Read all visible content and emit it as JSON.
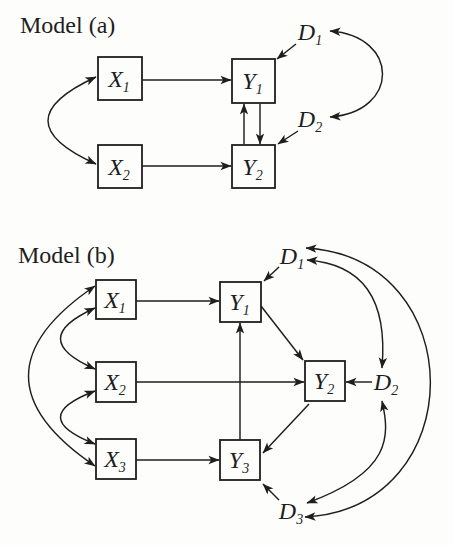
{
  "figure": {
    "background": "#fdfdfb",
    "ink": "#1e1e1e",
    "models": [
      {
        "id": "a",
        "title": "Model (a)",
        "nodes": [
          {
            "id": "X1",
            "letter": "X",
            "sub": "1",
            "box": {
              "x": 98,
              "y": 57,
              "w": 44,
              "h": 43
            }
          },
          {
            "id": "X2",
            "letter": "X",
            "sub": "2",
            "box": {
              "x": 98,
              "y": 145,
              "w": 44,
              "h": 43
            }
          },
          {
            "id": "Y1",
            "letter": "Y",
            "sub": "1",
            "box": {
              "x": 232,
              "y": 59,
              "w": 43,
              "h": 44
            }
          },
          {
            "id": "Y2",
            "letter": "Y",
            "sub": "2",
            "box": {
              "x": 232,
              "y": 145,
              "w": 43,
              "h": 43
            }
          }
        ],
        "free_labels": [
          {
            "id": "D1",
            "letter": "D",
            "sub": "1",
            "cx": 310,
            "cy": 32
          },
          {
            "id": "D2",
            "letter": "D",
            "sub": "2",
            "cx": 310,
            "cy": 119
          }
        ],
        "edges": [
          {
            "id": "a-x1-y1",
            "from": "X1",
            "to": "Y1",
            "arrows": "end",
            "d": "M 142 80 L 231 80"
          },
          {
            "id": "a-x2-y2",
            "from": "X2",
            "to": "Y2",
            "arrows": "end",
            "d": "M 142 166 L 231 166"
          },
          {
            "id": "a-y2-y1",
            "from": "Y2",
            "to": "Y1",
            "arrows": "end",
            "d": "M 244 144 L 244 104"
          },
          {
            "id": "a-y1-y2",
            "from": "Y1",
            "to": "Y2",
            "arrows": "end",
            "d": "M 260 104 L 260 144"
          },
          {
            "id": "a-d1-y1",
            "from": "D1",
            "to": "Y1",
            "arrows": "end",
            "d": "M 296 44 L 277 59"
          },
          {
            "id": "a-d2-y2",
            "from": "D2",
            "to": "Y2",
            "arrows": "end",
            "d": "M 298 131 L 278 144"
          },
          {
            "id": "a-x1-x2",
            "from": "X1",
            "to": "X2",
            "arrows": "both",
            "d": "M 96 77 Q 0 121 96 164"
          },
          {
            "id": "a-d1-d2",
            "from": "D1",
            "to": "D2",
            "arrows": "both",
            "d": "M 330 31 C 400 36 400 112 330 117"
          }
        ]
      },
      {
        "id": "b",
        "title": "Model (b)",
        "nodes": [
          {
            "id": "bX1",
            "letter": "X",
            "sub": "1",
            "box": {
              "x": 96,
              "y": 280,
              "w": 40,
              "h": 39
            }
          },
          {
            "id": "bX2",
            "letter": "X",
            "sub": "2",
            "box": {
              "x": 96,
              "y": 362,
              "w": 40,
              "h": 40
            }
          },
          {
            "id": "bX3",
            "letter": "X",
            "sub": "3",
            "box": {
              "x": 96,
              "y": 439,
              "w": 40,
              "h": 40
            }
          },
          {
            "id": "bY1",
            "letter": "Y",
            "sub": "1",
            "box": {
              "x": 220,
              "y": 282,
              "w": 41,
              "h": 40
            }
          },
          {
            "id": "bY2",
            "letter": "Y",
            "sub": "2",
            "box": {
              "x": 305,
              "y": 361,
              "w": 40,
              "h": 40
            }
          },
          {
            "id": "bY3",
            "letter": "Y",
            "sub": "3",
            "box": {
              "x": 220,
              "y": 440,
              "w": 40,
              "h": 40
            }
          }
        ],
        "free_labels": [
          {
            "id": "D1",
            "letter": "D",
            "sub": "1",
            "cx": 292,
            "cy": 256
          },
          {
            "id": "D2",
            "letter": "D",
            "sub": "2",
            "cx": 386,
            "cy": 382
          },
          {
            "id": "D3",
            "letter": "D",
            "sub": "3",
            "cx": 291,
            "cy": 511
          }
        ],
        "edges": [
          {
            "id": "b-x1-y1",
            "from": "X1",
            "to": "Y1",
            "arrows": "end",
            "d": "M 136 301 L 219 301"
          },
          {
            "id": "b-x2-y2",
            "from": "X2",
            "to": "Y2",
            "arrows": "end",
            "d": "M 136 382 L 304 382"
          },
          {
            "id": "b-x3-y3",
            "from": "X3",
            "to": "Y3",
            "arrows": "end",
            "d": "M 136 460 L 219 460"
          },
          {
            "id": "b-y3-y1",
            "from": "Y3",
            "to": "Y1",
            "arrows": "end",
            "d": "M 240 440 L 240 323"
          },
          {
            "id": "b-y1-y2",
            "from": "Y1",
            "to": "Y2",
            "arrows": "end",
            "d": "M 261 306 L 303 360"
          },
          {
            "id": "b-y2-y3",
            "from": "Y2",
            "to": "Y3",
            "arrows": "end",
            "d": "M 309 404 L 263 453"
          },
          {
            "id": "b-d1-y1",
            "from": "D1",
            "to": "Y1",
            "arrows": "end",
            "d": "M 279 267 L 264 281"
          },
          {
            "id": "b-d2-y2",
            "from": "D2",
            "to": "Y2",
            "arrows": "end",
            "d": "M 372 382 L 346 382"
          },
          {
            "id": "b-d3-y3",
            "from": "D3",
            "to": "Y3",
            "arrows": "end",
            "d": "M 279 500 L 263 484"
          },
          {
            "id": "b-x1-x2",
            "from": "X1",
            "to": "X2",
            "arrows": "both",
            "d": "M 95 308 Q 26 339 95 369"
          },
          {
            "id": "b-x2-x3",
            "from": "X2",
            "to": "X3",
            "arrows": "both",
            "d": "M 95 391 Q 26 417 95 444"
          },
          {
            "id": "b-x1-x3",
            "from": "X1",
            "to": "X3",
            "arrows": "both",
            "d": "M 95 286 Q -38 376 95 466"
          },
          {
            "id": "b-d1-d2",
            "from": "D1",
            "to": "D2",
            "arrows": "both",
            "d": "M 307 260 C 362 264 388 298 382 368"
          },
          {
            "id": "b-d2-d3",
            "from": "D2",
            "to": "D3",
            "arrows": "both",
            "d": "M 382 401 C 390 436 392 472 307 503"
          },
          {
            "id": "b-d1-d3",
            "from": "D1",
            "to": "D3",
            "arrows": "both",
            "d": "M 306 248 C 472 258 472 508 305 517"
          }
        ]
      }
    ]
  }
}
